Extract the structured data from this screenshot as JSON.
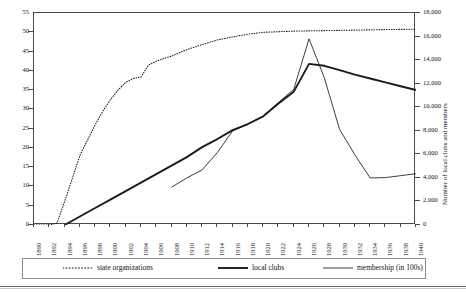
{
  "chart_data": {
    "type": "line",
    "title": "",
    "xlabel": "",
    "ylabel": "",
    "y2label": "Number of local clubs and members",
    "grid": false,
    "legend_position": "bottom",
    "x": [
      1890,
      1892,
      1894,
      1896,
      1898,
      1900,
      1902,
      1904,
      1906,
      1908,
      1910,
      1912,
      1914,
      1916,
      1918,
      1920,
      1922,
      1924,
      1926,
      1928,
      1930,
      1932,
      1934,
      1936,
      1938,
      1940
    ],
    "xtick_labels": [
      "1890",
      "1892",
      "1894",
      "1896",
      "1898",
      "1900",
      "1902",
      "1904",
      "1906",
      "1908",
      "1910",
      "1912",
      "1914",
      "1916",
      "1918",
      "1920",
      "1922",
      "1924",
      "1926",
      "1928",
      "1930",
      "1932",
      "1934",
      "1936",
      "1938",
      "1940"
    ],
    "xlim": [
      1890,
      1940
    ],
    "ylim": [
      0,
      55
    ],
    "ytick_labels": [
      "0",
      "5",
      "10",
      "15",
      "20",
      "25",
      "30",
      "35",
      "40",
      "45",
      "50",
      "55"
    ],
    "ytick_values": [
      0,
      5,
      10,
      15,
      20,
      25,
      30,
      35,
      40,
      45,
      50,
      55
    ],
    "y2lim": [
      0,
      18000
    ],
    "y2tick_labels": [
      "0",
      "2,000",
      "4,000",
      "6,000",
      "8,000",
      "10,000",
      "12,000",
      "14,000",
      "16,000",
      "18,000"
    ],
    "y2tick_values": [
      0,
      2000,
      4000,
      6000,
      8000,
      10000,
      12000,
      14000,
      16000,
      18000
    ],
    "series": [
      {
        "name": "state organizations",
        "style": "dotted",
        "axis": "left",
        "points": [
          [
            1890,
            0
          ],
          [
            1892,
            0
          ],
          [
            1893,
            0.5
          ],
          [
            1894,
            6
          ],
          [
            1895,
            12
          ],
          [
            1896,
            18
          ],
          [
            1897,
            22
          ],
          [
            1898,
            26
          ],
          [
            1899,
            29.5
          ],
          [
            1900,
            32.5
          ],
          [
            1901,
            35
          ],
          [
            1902,
            37
          ],
          [
            1903,
            38
          ],
          [
            1904,
            38.4
          ],
          [
            1905,
            41.5
          ],
          [
            1906,
            42.5
          ],
          [
            1907,
            43.2
          ],
          [
            1908,
            43.8
          ],
          [
            1910,
            45.5
          ],
          [
            1912,
            46.8
          ],
          [
            1914,
            48
          ],
          [
            1916,
            48.8
          ],
          [
            1918,
            49.5
          ],
          [
            1920,
            50
          ],
          [
            1924,
            50.3
          ],
          [
            1930,
            50.5
          ],
          [
            1936,
            50.7
          ],
          [
            1940,
            50.8
          ]
        ]
      },
      {
        "name": "local clubs",
        "style": "solid-thick",
        "axis": "left",
        "points": [
          [
            1894,
            0
          ],
          [
            1896,
            2.2
          ],
          [
            1898,
            4.4
          ],
          [
            1900,
            6.6
          ],
          [
            1902,
            8.8
          ],
          [
            1904,
            11
          ],
          [
            1906,
            13.2
          ],
          [
            1908,
            15.4
          ],
          [
            1910,
            17.6
          ],
          [
            1912,
            20.2
          ],
          [
            1914,
            22.3
          ],
          [
            1916,
            24.6
          ],
          [
            1918,
            26.2
          ],
          [
            1920,
            28.2
          ],
          [
            1922,
            31.5
          ],
          [
            1924,
            34.6
          ],
          [
            1926,
            41.8
          ],
          [
            1928,
            41.3
          ],
          [
            1930,
            40.2
          ],
          [
            1932,
            39
          ],
          [
            1934,
            38
          ],
          [
            1936,
            37
          ],
          [
            1938,
            36
          ],
          [
            1940,
            35
          ]
        ]
      },
      {
        "name": "membership (in 100s)",
        "style": "solid-thin",
        "axis": "left",
        "points": [
          [
            1908,
            9.8
          ],
          [
            1910,
            12.2
          ],
          [
            1912,
            14.3
          ],
          [
            1914,
            18.8
          ],
          [
            1916,
            24.4
          ],
          [
            1918,
            26.2
          ],
          [
            1920,
            28.2
          ],
          [
            1922,
            31.8
          ],
          [
            1924,
            35.2
          ],
          [
            1926,
            48.3
          ],
          [
            1928,
            38.2
          ],
          [
            1930,
            24.8
          ],
          [
            1932,
            18.2
          ],
          [
            1934,
            12.2
          ],
          [
            1936,
            12.3
          ],
          [
            1938,
            12.8
          ],
          [
            1940,
            13.3
          ]
        ]
      }
    ],
    "legend": [
      {
        "label": "state organizations",
        "style": "dotted"
      },
      {
        "label": "local clubs",
        "style": "solid-thick"
      },
      {
        "label": "membership (in 100s)",
        "style": "solid-thin"
      }
    ],
    "colors": {
      "line": "#1a1a1a",
      "axis": "#4a4a4a",
      "legend_border": "#8d8d8d",
      "background": "#ffffff"
    }
  }
}
